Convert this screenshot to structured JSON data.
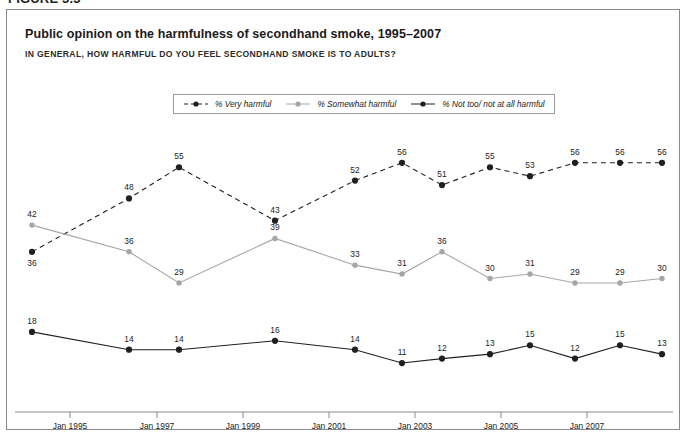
{
  "figure": {
    "number": "FIGURE 3.3"
  },
  "chart": {
    "title": "Public opinion on the harmfulness of secondhand smoke, 1995–2007",
    "subtitle": "IN GENERAL, HOW HARMFUL DO YOU FEEL SECONDHAND SMOKE IS TO ADULTS?"
  },
  "colors": {
    "very_harmful": "#231f20",
    "somewhat_harmful": "#a6a6a6",
    "not_harmful": "#231f20",
    "axis": "#8a8a8a",
    "border": "#8a8a8a",
    "text": "#1c1c1c"
  },
  "legend": {
    "position": "top-center",
    "items": [
      {
        "label": "% Very harmful",
        "style": "dashed",
        "color": "#231f20",
        "marker": "circle"
      },
      {
        "label": "% Somewhat harmful",
        "style": "solid",
        "color": "#a6a6a6",
        "marker": "circle"
      },
      {
        "label": "% Not too/ not at all harmful",
        "style": "solid",
        "color": "#231f20",
        "marker": "circle"
      }
    ]
  },
  "chart_data": {
    "type": "line",
    "title": "Public opinion on the harmfulness of secondhand smoke, 1995–2007",
    "subtitle": "IN GENERAL, HOW HARMFUL DO YOU FEEL SECONDHAND SMOKE IS TO ADULTS?",
    "xlabel": "",
    "ylabel": "",
    "grid": false,
    "legend_position": "top-center",
    "ylim": [
      0,
      60
    ],
    "x": [
      "Jan 1994",
      "Jan 1996",
      "Jan 1997",
      "Jan 1999",
      "Jan 2000",
      "Jan 2001",
      "Jan 2002",
      "Jan 2003",
      "Jan 2004",
      "Jan 2005",
      "Jan 2006",
      "Jan 2007"
    ],
    "x_positions": [
      25,
      122,
      172,
      268,
      348,
      395,
      435,
      483,
      523,
      568,
      613,
      655
    ],
    "xtick_labels": [
      "Jan 1995",
      "Jan 1997",
      "Jan 1999",
      "Jan 2001",
      "Jan 2003",
      "Jan 2005",
      "Jan 2007"
    ],
    "xtick_positions": [
      63,
      150,
      236,
      322,
      408,
      494,
      580
    ],
    "series": [
      {
        "name": "% Very harmful",
        "color": "#231f20",
        "style": "dashed",
        "values": [
          36,
          48,
          55,
          43,
          52,
          56,
          51,
          55,
          53,
          56,
          56,
          56
        ]
      },
      {
        "name": "% Somewhat harmful",
        "color": "#a6a6a6",
        "style": "solid",
        "values": [
          42,
          36,
          29,
          39,
          33,
          31,
          36,
          30,
          31,
          29,
          29,
          30
        ]
      },
      {
        "name": "% Not too/ not at all harmful",
        "color": "#231f20",
        "style": "solid",
        "values": [
          18,
          14,
          14,
          16,
          14,
          11,
          12,
          13,
          15,
          12,
          15,
          13
        ]
      }
    ]
  }
}
